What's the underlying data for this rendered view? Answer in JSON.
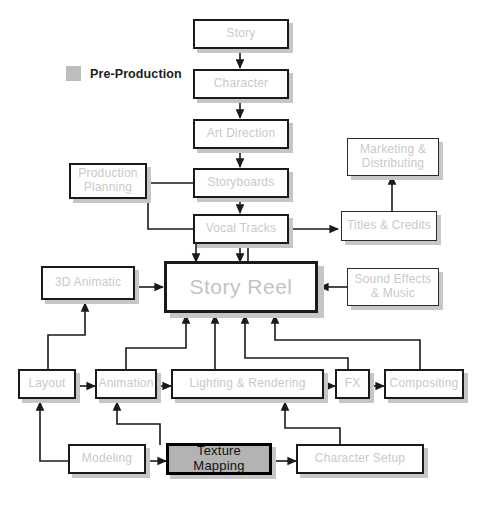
{
  "diagram": {
    "canvas": {
      "width": 490,
      "height": 509,
      "background": "#ffffff"
    },
    "legend": {
      "swatch_color": "#bdbdbd",
      "label": "Pre-Production"
    },
    "styles": {
      "box_fill": "#ffffff",
      "box_border": "#1a1a1a",
      "label_color": "#c9c9c9",
      "shadow_color": "#c6c6c6",
      "highlight_fill": "#b3b3b3",
      "highlight_text": "#111111",
      "connector_color": "#1a1a1a"
    },
    "nodes": [
      {
        "id": "story",
        "label": "Story",
        "stage": "pre-production"
      },
      {
        "id": "character",
        "label": "Character",
        "stage": "pre-production"
      },
      {
        "id": "art_direction",
        "label": "Art Direction",
        "stage": "pre-production"
      },
      {
        "id": "storyboards",
        "label": "Storyboards",
        "stage": "pre-production"
      },
      {
        "id": "vocal_tracks",
        "label": "Vocal Tracks",
        "stage": "pre-production"
      },
      {
        "id": "prod_planning",
        "label": "Production Planning",
        "stage": "pre-production"
      },
      {
        "id": "story_reel",
        "label": "Story Reel",
        "stage": "hub"
      },
      {
        "id": "animatic_3d",
        "label": "3D Animatic",
        "stage": "production"
      },
      {
        "id": "marketing",
        "label": "Marketing & Distributing",
        "stage": "post"
      },
      {
        "id": "titles",
        "label": "Titles & Credits",
        "stage": "post"
      },
      {
        "id": "sound",
        "label": "Sound Effects & Music",
        "stage": "post"
      },
      {
        "id": "layout",
        "label": "Layout",
        "stage": "production"
      },
      {
        "id": "animation",
        "label": "Animation",
        "stage": "production"
      },
      {
        "id": "lighting",
        "label": "Lighting & Rendering",
        "stage": "production"
      },
      {
        "id": "fx",
        "label": "FX",
        "stage": "production"
      },
      {
        "id": "compositing",
        "label": "Compositing",
        "stage": "production"
      },
      {
        "id": "modeling",
        "label": "Modeling",
        "stage": "production"
      },
      {
        "id": "texture",
        "label": "Texture Mapping",
        "stage": "production",
        "highlighted": true
      },
      {
        "id": "char_setup",
        "label": "Character Setup",
        "stage": "production"
      }
    ],
    "edges": [
      {
        "from": "story",
        "to": "character"
      },
      {
        "from": "character",
        "to": "art_direction"
      },
      {
        "from": "art_direction",
        "to": "storyboards"
      },
      {
        "from": "storyboards",
        "to": "vocal_tracks"
      },
      {
        "from": "storyboards",
        "to": "prod_planning"
      },
      {
        "from": "vocal_tracks",
        "to": "story_reel"
      },
      {
        "from": "prod_planning",
        "to": "story_reel"
      },
      {
        "from": "animatic_3d",
        "to": "story_reel"
      },
      {
        "from": "sound",
        "to": "story_reel"
      },
      {
        "from": "story_reel",
        "to": "titles"
      },
      {
        "from": "titles",
        "to": "marketing"
      },
      {
        "from": "layout",
        "to": "animatic_3d"
      },
      {
        "from": "layout",
        "to": "animation"
      },
      {
        "from": "animation",
        "to": "lighting"
      },
      {
        "from": "animation",
        "to": "story_reel"
      },
      {
        "from": "lighting",
        "to": "fx"
      },
      {
        "from": "lighting",
        "to": "story_reel"
      },
      {
        "from": "fx",
        "to": "compositing"
      },
      {
        "from": "fx",
        "to": "story_reel"
      },
      {
        "from": "compositing",
        "to": "story_reel"
      },
      {
        "from": "modeling",
        "to": "layout"
      },
      {
        "from": "modeling",
        "to": "texture"
      },
      {
        "from": "texture",
        "to": "animation"
      },
      {
        "from": "texture",
        "to": "char_setup"
      },
      {
        "from": "char_setup",
        "to": "lighting"
      }
    ]
  }
}
